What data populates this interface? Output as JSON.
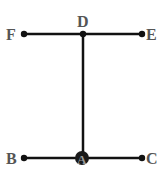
{
  "diagram": {
    "type": "graph",
    "nodes": [
      {
        "id": "F",
        "label": "F",
        "x": 24,
        "y": 34
      },
      {
        "id": "D",
        "label": "D",
        "x": 84,
        "y": 34
      },
      {
        "id": "E",
        "label": "E",
        "x": 142,
        "y": 34
      },
      {
        "id": "B",
        "label": "B",
        "x": 24,
        "y": 158
      },
      {
        "id": "A",
        "label": "A",
        "x": 82,
        "y": 158
      },
      {
        "id": "C",
        "label": "C",
        "x": 142,
        "y": 158
      }
    ],
    "edges": [
      [
        "F",
        "D"
      ],
      [
        "D",
        "E"
      ],
      [
        "D",
        "A"
      ],
      [
        "B",
        "A"
      ],
      [
        "A",
        "C"
      ]
    ],
    "labels": {
      "F": "F",
      "D": "D",
      "E": "E",
      "B": "B",
      "A": "A",
      "C": "C"
    },
    "colors": {
      "line": "#111111",
      "label": "#555555",
      "node_a_fill": "#1a1a1a",
      "node_a_text": "#999999"
    }
  }
}
